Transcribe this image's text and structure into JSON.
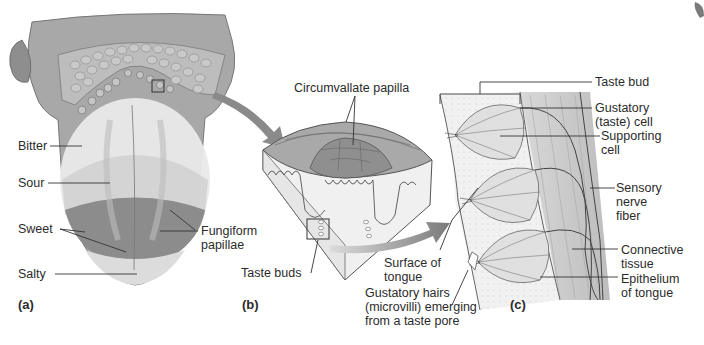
{
  "figure": {
    "panels": [
      {
        "id": "a",
        "label": "(a)"
      },
      {
        "id": "b",
        "label": "(b)"
      },
      {
        "id": "c",
        "label": "(c)"
      }
    ],
    "panel_a": {
      "subject": "tongue-dorsal-view",
      "labels": {
        "bitter": "Bitter",
        "sour": "Sour",
        "sweet": "Sweet",
        "salty": "Salty",
        "fungiform": "Fungiform\npapillae"
      }
    },
    "panel_b": {
      "subject": "circumvallate-papilla-block",
      "labels": {
        "circumvallate": "Circumvallate papilla",
        "taste_buds": "Taste buds"
      }
    },
    "panel_c": {
      "subject": "taste-bud-detail",
      "labels": {
        "taste_bud": "Taste bud",
        "gustatory_cell": "Gustatory\n(taste) cell",
        "supporting_cell": "Supporting\ncell",
        "sensory_nerve": "Sensory\nnerve\nfiber",
        "connective_tissue": "Connective\ntissue",
        "epithelium": "Epithelium\nof tongue",
        "surface": "Surface of\ntongue",
        "gustatory_hairs": "Gustatory hairs\n(microvilli) emerging\nfrom a taste pore"
      }
    },
    "colors": {
      "tongue_base": "#a9a9a9",
      "papillae": "#b8b8b8",
      "bitter_zone": "#e6e6e6",
      "sour_zone": "#d2d2d2",
      "sweet_zone": "#8d8d8d",
      "salty_zone": "#d9d9d9",
      "arrow": "#8a8a8a",
      "leader_line": "#333333",
      "tissue_light": "#eeeeee",
      "connective": "#cfcfcf"
    }
  }
}
